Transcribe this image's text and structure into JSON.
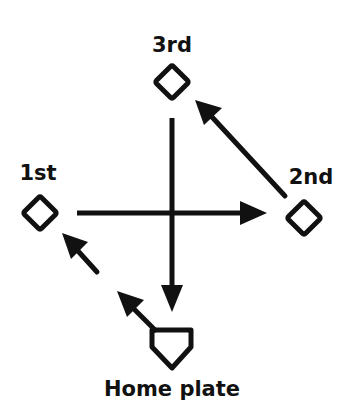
{
  "diagram": {
    "type": "baseball-diamond-run-paths",
    "colors": {
      "ink": "#111111",
      "background": "#ffffff"
    },
    "bases": [
      {
        "id": "third",
        "label": "3rd",
        "shape": "diamond"
      },
      {
        "id": "first",
        "label": "1st",
        "shape": "diamond"
      },
      {
        "id": "second",
        "label": "2nd",
        "shape": "diamond"
      },
      {
        "id": "home",
        "label": "Home plate",
        "shape": "pentagon"
      }
    ],
    "arrows": [
      {
        "from": "third",
        "to": "home",
        "direction": "down"
      },
      {
        "from": "first",
        "to": "second",
        "direction": "right"
      },
      {
        "from": "second",
        "to": "third",
        "direction": "up-left"
      },
      {
        "from": "home",
        "to": "first",
        "direction": "up-left",
        "segments": 2
      }
    ]
  }
}
